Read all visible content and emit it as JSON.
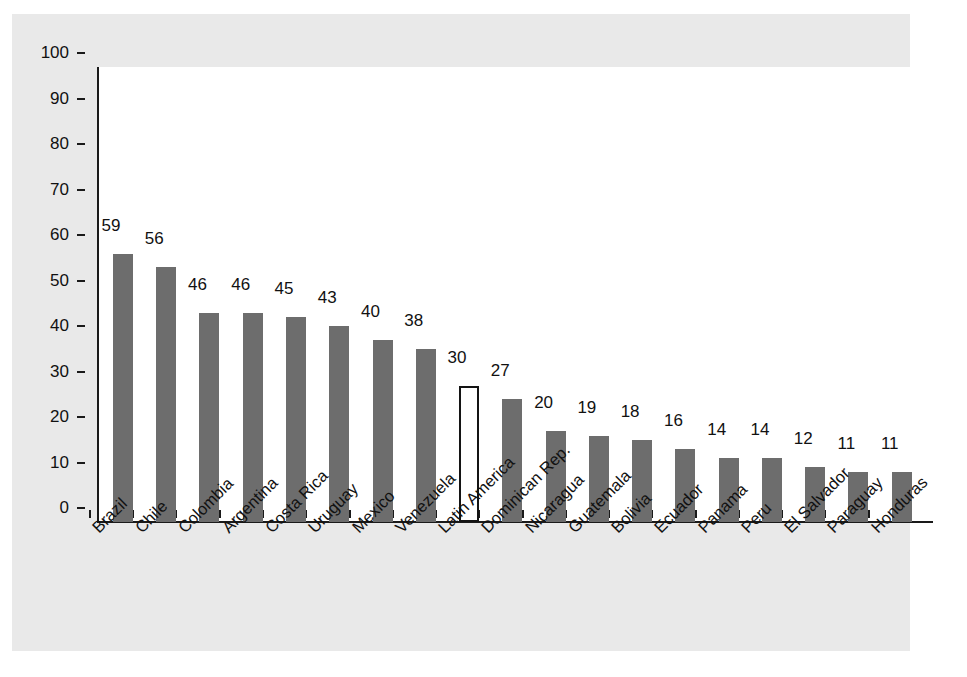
{
  "chart_data": {
    "type": "bar",
    "title": "",
    "subtitle": "",
    "xlabel": "",
    "ylabel": "",
    "ylim": [
      0,
      100
    ],
    "y_ticks": [
      0,
      10,
      20,
      30,
      40,
      50,
      60,
      70,
      80,
      90,
      100
    ],
    "grid": false,
    "legend": "none",
    "categories": [
      "Brazil",
      "Chile",
      "Colombia",
      "Argentina",
      "Costa Rica",
      "Uruguay",
      "Mexico",
      "Venezuela",
      "Latin America",
      "Dominican Rep.",
      "Nicaragua",
      "Guatemala",
      "Bolivia",
      "Ecuador",
      "Panama",
      "Peru",
      "El Salvador",
      "Paraguay",
      "Honduras"
    ],
    "values": [
      59,
      56,
      46,
      46,
      45,
      43,
      40,
      38,
      30,
      27,
      20,
      19,
      18,
      16,
      14,
      14,
      12,
      11,
      11
    ],
    "highlight_index": 8,
    "highlight_category": "Latin America",
    "series": [
      {
        "name": "",
        "values": [
          59,
          56,
          46,
          46,
          45,
          43,
          40,
          38,
          30,
          27,
          20,
          19,
          18,
          16,
          14,
          14,
          12,
          11,
          11
        ]
      }
    ]
  },
  "colors": {
    "bar_fill": "#6d6d6d",
    "highlight_fill": "#ffffff",
    "highlight_stroke": "#141414",
    "axis": "#1a1a1a",
    "plot_background": "#ffffff",
    "figure_background": "#e9e9e9",
    "page_background": "#ffffff",
    "text": "#111111"
  }
}
